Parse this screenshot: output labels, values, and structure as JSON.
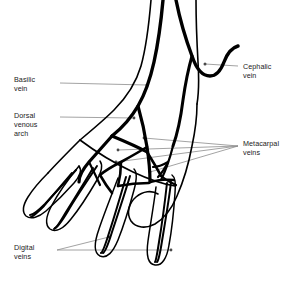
{
  "figure": {
    "style": "black line art on white background",
    "stroke_color": "#000000",
    "leader_color": "#8c8c8c",
    "background": "#ffffff"
  },
  "labels": [
    {
      "id": "basilic",
      "text": "Basilic\nvein",
      "side": "left",
      "lines": [
        "Basilic",
        "vein"
      ]
    },
    {
      "id": "dorsal",
      "text": "Dorsal\nvenous\narch",
      "side": "left",
      "lines": [
        "Dorsal",
        "venous",
        "arch"
      ]
    },
    {
      "id": "digital",
      "text": "Digital\nveins",
      "side": "left",
      "lines": [
        "Digital",
        "veins"
      ]
    },
    {
      "id": "cephalic",
      "text": "Cephalic\nvein",
      "side": "right",
      "lines": [
        "Cephalic",
        "vein"
      ]
    },
    {
      "id": "metacarpal",
      "text": "Metacarpal\nveins",
      "side": "right",
      "lines": [
        "Metacarpal",
        "veins"
      ]
    }
  ],
  "anatomy": {
    "structures": [
      "basilic vein",
      "cephalic vein",
      "dorsal venous arch",
      "metacarpal veins",
      "digital veins"
    ],
    "view": "dorsal view of left hand and distal forearm",
    "digits": 5
  }
}
